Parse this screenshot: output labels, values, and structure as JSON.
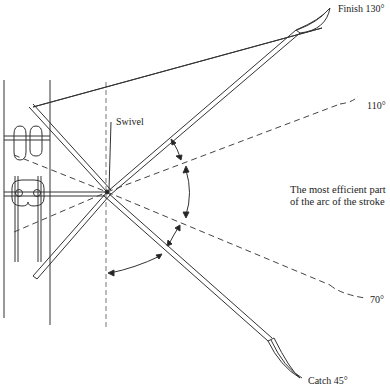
{
  "diagram": {
    "labels": {
      "finish": "Finish 130°",
      "angle_110": "110°",
      "angle_70": "70°",
      "catch": "Catch 45°",
      "swivel": "Swivel",
      "efficient_line1": "The most efficient part",
      "efficient_line2": "of the arc of the stroke"
    },
    "swivel_point": {
      "x": 107,
      "y": 192
    },
    "oar_positions_deg": [
      45,
      70,
      110,
      130
    ],
    "colors": {
      "line": "#333333",
      "background": "#ffffff"
    }
  }
}
